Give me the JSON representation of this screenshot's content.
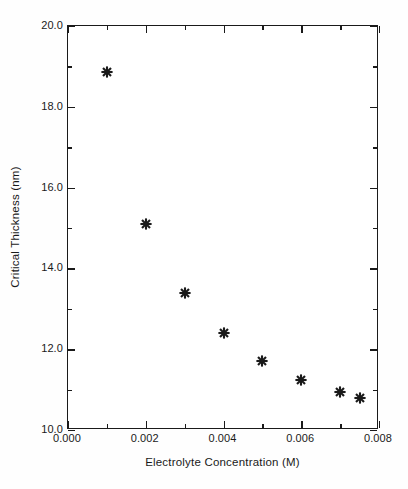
{
  "chart_data": {
    "type": "scatter",
    "title": "",
    "xlabel": "Electrolyte Concentration (M)",
    "ylabel": "Critical Thickness (nm)",
    "xlim": [
      0.0,
      0.008
    ],
    "ylim": [
      10.0,
      20.0
    ],
    "grid": false,
    "legend": null,
    "marker": "asterisk",
    "marker_color": "#1a1a1a",
    "x": [
      0.001,
      0.002,
      0.003,
      0.004,
      0.005,
      0.006,
      0.007,
      0.0075
    ],
    "y": [
      18.85,
      15.1,
      13.4,
      12.4,
      11.7,
      11.25,
      10.95,
      10.8
    ],
    "points": [
      {
        "x": 0.001,
        "y": 18.85,
        "label": "(0.0010, 18.85)"
      },
      {
        "x": 0.002,
        "y": 15.1,
        "label": "(0.0020, 15.10)"
      },
      {
        "x": 0.003,
        "y": 13.4,
        "label": "(0.0030, 13.40)"
      },
      {
        "x": 0.004,
        "y": 12.4,
        "label": "(0.0040, 12.40)"
      },
      {
        "x": 0.005,
        "y": 11.7,
        "label": "(0.0050, 11.70)"
      },
      {
        "x": 0.006,
        "y": 11.25,
        "label": "(0.0060, 11.25)"
      },
      {
        "x": 0.007,
        "y": 10.95,
        "label": "(0.0070, 10.95)"
      },
      {
        "x": 0.0075,
        "y": 10.8,
        "label": "(0.0075, 10.80)"
      }
    ],
    "xticks": [
      {
        "value": 0.0,
        "label": "0.000",
        "major": true
      },
      {
        "value": 0.001,
        "label": "",
        "major": false
      },
      {
        "value": 0.002,
        "label": "0.002",
        "major": true
      },
      {
        "value": 0.003,
        "label": "",
        "major": false
      },
      {
        "value": 0.004,
        "label": "0.004",
        "major": true
      },
      {
        "value": 0.005,
        "label": "",
        "major": false
      },
      {
        "value": 0.006,
        "label": "0.006",
        "major": true
      },
      {
        "value": 0.007,
        "label": "",
        "major": false
      },
      {
        "value": 0.008,
        "label": "0.008",
        "major": true
      }
    ],
    "yticks": [
      {
        "value": 20.0,
        "label": "20.0",
        "major": true
      },
      {
        "value": 19.0,
        "label": "",
        "major": false
      },
      {
        "value": 18.0,
        "label": "18.0",
        "major": true
      },
      {
        "value": 17.0,
        "label": "",
        "major": false
      },
      {
        "value": 16.0,
        "label": "16.0",
        "major": true
      },
      {
        "value": 15.0,
        "label": "",
        "major": false
      },
      {
        "value": 14.0,
        "label": "14.0",
        "major": true
      },
      {
        "value": 13.0,
        "label": "",
        "major": false
      },
      {
        "value": 12.0,
        "label": "12.0",
        "major": true
      },
      {
        "value": 11.0,
        "label": "",
        "major": false
      },
      {
        "value": 10.0,
        "label": "10.0",
        "major": true
      }
    ]
  },
  "figure": {
    "background_color": "#fefefe",
    "plot_background_color": "#ffffff",
    "frame_color": "#1a1a1a",
    "text_color": "#1a1a1a"
  }
}
